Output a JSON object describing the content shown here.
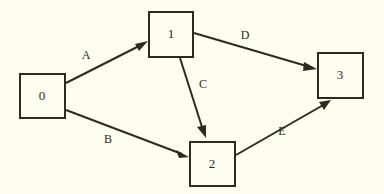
{
  "diagram": {
    "type": "directed-graph",
    "title": "",
    "background_color": "#fefef0",
    "stroke_color": "#2b2b20",
    "nodes": [
      {
        "id": "0",
        "label": "0",
        "shape": "square",
        "x": 20,
        "y": 74,
        "w": 45,
        "h": 44
      },
      {
        "id": "1",
        "label": "1",
        "shape": "square",
        "x": 149,
        "y": 12,
        "w": 44,
        "h": 45
      },
      {
        "id": "2",
        "label": "2",
        "shape": "square",
        "x": 190,
        "y": 142,
        "w": 45,
        "h": 44
      },
      {
        "id": "3",
        "label": "3",
        "shape": "square",
        "x": 318,
        "y": 53,
        "w": 45,
        "h": 45
      }
    ],
    "edges": [
      {
        "id": "A",
        "label": "A",
        "from": "0",
        "to": "1",
        "x1": 66,
        "y1": 83,
        "x2": 147,
        "y2": 42,
        "label_x": 86,
        "label_y": 56
      },
      {
        "id": "B",
        "label": "B",
        "from": "0",
        "to": "2",
        "x1": 66,
        "y1": 110,
        "x2": 188,
        "y2": 157,
        "label_x": 108,
        "label_y": 140
      },
      {
        "id": "C",
        "label": "C",
        "from": "1",
        "to": "2",
        "x1": 180,
        "y1": 58,
        "x2": 206,
        "y2": 138,
        "label_x": 203,
        "label_y": 85
      },
      {
        "id": "D",
        "label": "D",
        "from": "1",
        "to": "3",
        "x1": 194,
        "y1": 33,
        "x2": 316,
        "y2": 69,
        "label_x": 245,
        "label_y": 36
      },
      {
        "id": "E",
        "label": "E",
        "from": "2",
        "to": "3",
        "x1": 236,
        "y1": 155,
        "x2": 330,
        "y2": 100,
        "label_x": 282,
        "label_y": 132
      }
    ]
  }
}
